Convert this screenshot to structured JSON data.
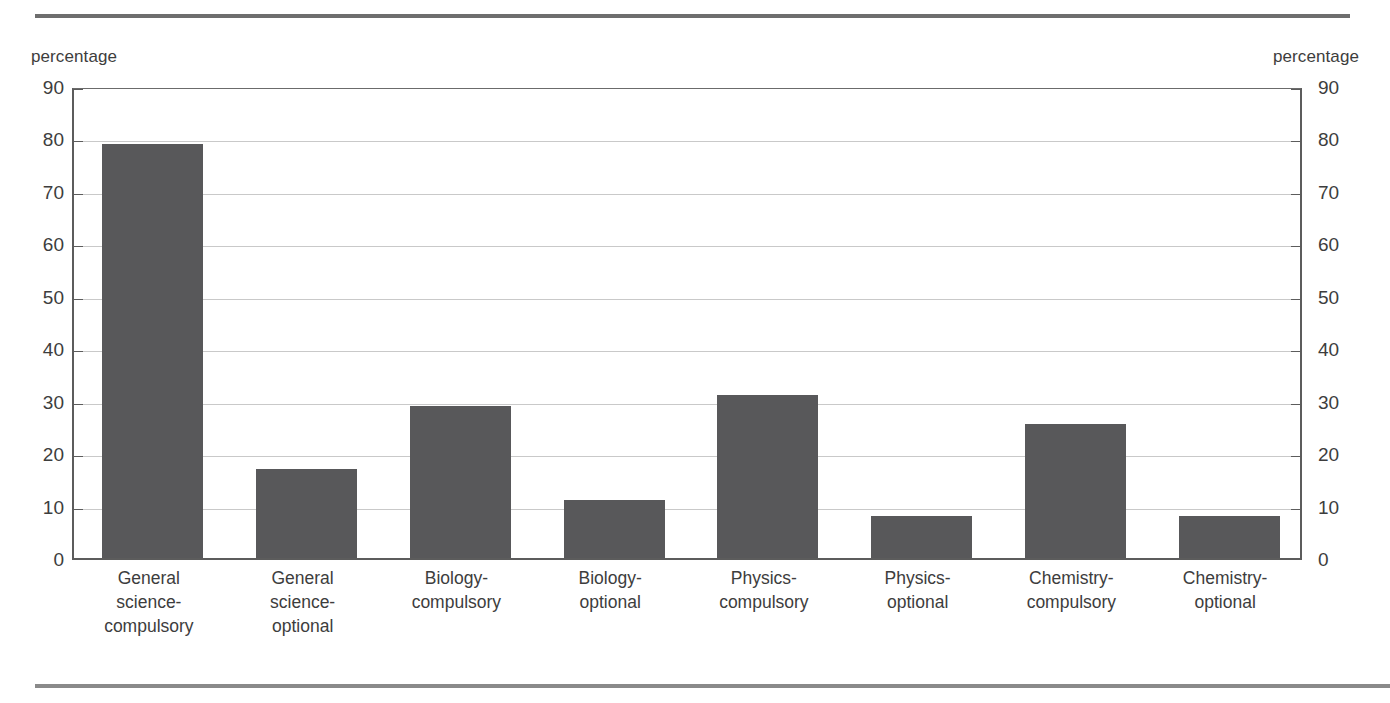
{
  "axis": {
    "left_unit": "percentage",
    "right_unit": "percentage",
    "ticks": [
      "90",
      "80",
      "70",
      "60",
      "50",
      "40",
      "30",
      "20",
      "10",
      "0"
    ]
  },
  "colors": {
    "bar_fill": "#58585a",
    "gridline": "#c9c9c9",
    "axis": "#5c5c5c",
    "rule": "#6e6e6e",
    "text": "#3d3d3d"
  },
  "chart_data": {
    "type": "bar",
    "title": "",
    "xlabel": "",
    "ylabel": "percentage",
    "ylim": [
      0,
      90
    ],
    "ytick_step": 10,
    "grid": true,
    "legend": "none",
    "categories": [
      "General science-compulsory",
      "General science-optional",
      "Biology-compulsory",
      "Biology-optional",
      "Physics-compulsory",
      "Physics-optional",
      "Chemistry-compulsory",
      "Chemistry-optional"
    ],
    "category_lines": [
      [
        "General",
        "science-",
        "compulsory"
      ],
      [
        "General",
        "science-",
        "optional"
      ],
      [
        "Biology-",
        "compulsory"
      ],
      [
        "Biology-",
        "optional"
      ],
      [
        "Physics-",
        "compulsory"
      ],
      [
        "Physics-",
        "optional"
      ],
      [
        "Chemistry-",
        "compulsory"
      ],
      [
        "Chemistry-",
        "optional"
      ]
    ],
    "values": [
      79,
      17,
      29,
      11,
      31,
      8,
      25.5,
      8
    ]
  }
}
